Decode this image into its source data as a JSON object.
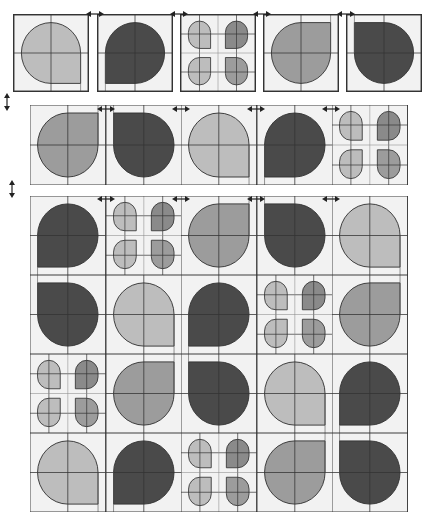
{
  "colors": {
    "light": "#bdbdbd",
    "medium": "#9c9c9c",
    "dark": "#4a4a4a",
    "petal_dark": "#8a8a8a",
    "background": "#f2f2f2",
    "line": "#333333"
  },
  "legend": {
    "tile_types": [
      "teardrop",
      "petals"
    ],
    "corner_positions": [
      "top-left",
      "top-right",
      "bottom-left",
      "bottom-right"
    ],
    "arrow_horizontal": "swap-horizontal",
    "arrow_vertical": "swap-vertical"
  },
  "row1": {
    "tiles": [
      {
        "type": "teardrop",
        "shade": "light",
        "corner": "bottom-right"
      },
      {
        "type": "teardrop",
        "shade": "dark",
        "corner": "bottom-left"
      },
      {
        "type": "petals",
        "shades": [
          "light",
          "petal_dark",
          "light",
          "medium"
        ]
      },
      {
        "type": "teardrop",
        "shade": "medium",
        "corner": "top-right"
      },
      {
        "type": "teardrop",
        "shade": "dark",
        "corner": "top-left"
      }
    ]
  },
  "row2": {
    "tiles": [
      {
        "type": "teardrop",
        "shade": "medium",
        "corner": "top-right"
      },
      {
        "type": "teardrop",
        "shade": "dark",
        "corner": "top-left"
      },
      {
        "type": "teardrop",
        "shade": "light",
        "corner": "bottom-right"
      },
      {
        "type": "teardrop",
        "shade": "dark",
        "corner": "bottom-left"
      },
      {
        "type": "petals",
        "shades": [
          "light",
          "petal_dark",
          "light",
          "medium"
        ]
      }
    ]
  },
  "grid": {
    "rows": [
      [
        {
          "type": "teardrop",
          "shade": "dark",
          "corner": "bottom-left"
        },
        {
          "type": "petals",
          "shades": [
            "light",
            "petal_dark",
            "light",
            "medium"
          ]
        },
        {
          "type": "teardrop",
          "shade": "medium",
          "corner": "top-right"
        },
        {
          "type": "teardrop",
          "shade": "dark",
          "corner": "top-left"
        },
        {
          "type": "teardrop",
          "shade": "light",
          "corner": "bottom-right"
        }
      ],
      [
        {
          "type": "teardrop",
          "shade": "dark",
          "corner": "top-left"
        },
        {
          "type": "teardrop",
          "shade": "light",
          "corner": "bottom-right"
        },
        {
          "type": "teardrop",
          "shade": "dark",
          "corner": "bottom-left"
        },
        {
          "type": "petals",
          "shades": [
            "light",
            "petal_dark",
            "light",
            "medium"
          ]
        },
        {
          "type": "teardrop",
          "shade": "medium",
          "corner": "top-right"
        }
      ],
      [
        {
          "type": "petals",
          "shades": [
            "light",
            "petal_dark",
            "light",
            "medium"
          ]
        },
        {
          "type": "teardrop",
          "shade": "medium",
          "corner": "top-right"
        },
        {
          "type": "teardrop",
          "shade": "dark",
          "corner": "top-left"
        },
        {
          "type": "teardrop",
          "shade": "light",
          "corner": "bottom-right"
        },
        {
          "type": "teardrop",
          "shade": "dark",
          "corner": "bottom-left"
        }
      ],
      [
        {
          "type": "teardrop",
          "shade": "light",
          "corner": "bottom-right"
        },
        {
          "type": "teardrop",
          "shade": "dark",
          "corner": "bottom-left"
        },
        {
          "type": "petals",
          "shades": [
            "light",
            "petal_dark",
            "light",
            "medium"
          ]
        },
        {
          "type": "teardrop",
          "shade": "medium",
          "corner": "top-right"
        },
        {
          "type": "teardrop",
          "shade": "dark",
          "corner": "top-left"
        }
      ]
    ]
  }
}
